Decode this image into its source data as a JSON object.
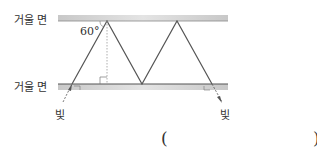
{
  "diagram": {
    "mirror_top_label": "거울 면",
    "mirror_bottom_label": "거울 면",
    "angle_label": "60°",
    "light_in_label": "빛",
    "light_out_label": "빛",
    "answer_open": "(",
    "answer_close": ")"
  }
}
